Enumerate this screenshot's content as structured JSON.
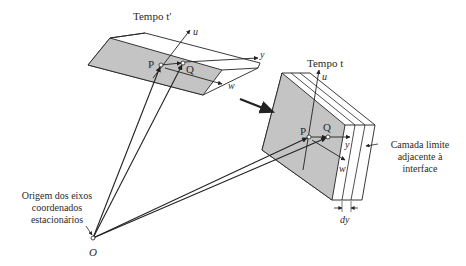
{
  "diagram": {
    "labels": {
      "time_prime": "Tempo t′",
      "time": "Tempo t",
      "point_p_left": "P",
      "point_q_left": "Q",
      "point_p_right": "P",
      "point_q_right": "Q",
      "axis_u_left": "u",
      "axis_y_left": "y",
      "axis_w_left": "w",
      "axis_u_right": "u",
      "axis_y_right": "y",
      "axis_w_right": "w",
      "origin": "O",
      "origin_desc_1": "Origem dos eixos",
      "origin_desc_2": "coordenados",
      "origin_desc_3": "estacionários",
      "boundary_1": "Camada limite",
      "boundary_2": "adjacente à",
      "boundary_3": "interface",
      "thickness": "dy"
    },
    "colors": {
      "shade": "#c4c4c4",
      "line": "#222222"
    }
  }
}
